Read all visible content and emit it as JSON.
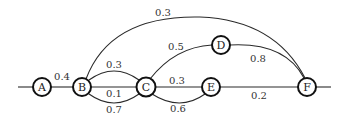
{
  "diagram": {
    "type": "weighted-graph",
    "nodes": [
      {
        "id": "A",
        "label": "A",
        "x": 42,
        "y": 87
      },
      {
        "id": "B",
        "label": "B",
        "x": 82,
        "y": 87
      },
      {
        "id": "C",
        "label": "C",
        "x": 146,
        "y": 87
      },
      {
        "id": "D",
        "label": "D",
        "x": 221,
        "y": 45
      },
      {
        "id": "E",
        "label": "E",
        "x": 211,
        "y": 87
      },
      {
        "id": "F",
        "label": "F",
        "x": 307,
        "y": 87
      }
    ],
    "edges": [
      {
        "from": "A",
        "to": "B",
        "weight": "0.4"
      },
      {
        "from": "B",
        "to": "C",
        "weight": "0.3",
        "shape": "upper-arc"
      },
      {
        "from": "B",
        "to": "C",
        "weight": "0.1",
        "shape": "straight"
      },
      {
        "from": "B",
        "to": "C",
        "weight": "0.7",
        "shape": "lower-arc"
      },
      {
        "from": "B",
        "to": "F",
        "weight": "0.3",
        "shape": "top-arc"
      },
      {
        "from": "C",
        "to": "D",
        "weight": "0.5"
      },
      {
        "from": "C",
        "to": "E",
        "weight": "0.3",
        "shape": "straight"
      },
      {
        "from": "C",
        "to": "E",
        "weight": "0.6",
        "shape": "lower-arc"
      },
      {
        "from": "D",
        "to": "F",
        "weight": "0.8"
      },
      {
        "from": "E",
        "to": "F",
        "weight": "0.2"
      }
    ],
    "stubs": [
      "incoming-left-of-A",
      "outgoing-right-of-F"
    ]
  }
}
